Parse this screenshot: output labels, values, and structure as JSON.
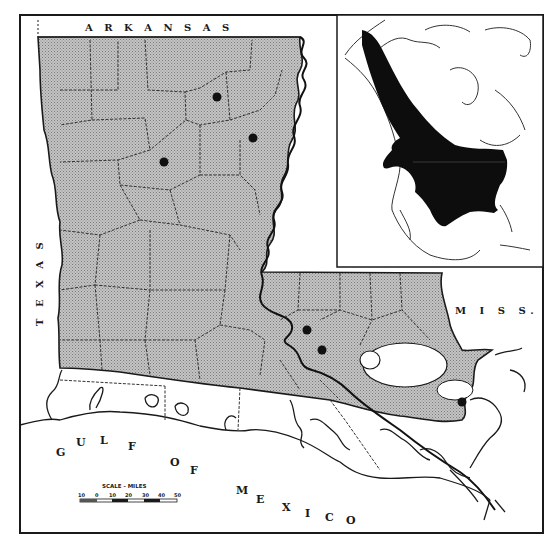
{
  "labels": {
    "north": "A R K A N S A S",
    "west": "T E X A S",
    "east": "M I S S.",
    "gulf_1": [
      "G",
      "U",
      "L",
      "F"
    ],
    "gulf_2": [
      "O",
      "F"
    ],
    "gulf_3": [
      "M",
      "E",
      "X",
      "I",
      "C",
      "O"
    ]
  },
  "scale": {
    "title": "SCALE - MILES",
    "ticks": [
      "10",
      "0",
      "10",
      "20",
      "30",
      "40",
      "50"
    ]
  },
  "colors": {
    "range_fill": "#b8b8b8",
    "inset_range": "#0d0d0d",
    "border": "#1a1a1a",
    "locality_dot": "#111111"
  },
  "locality_dots": [
    {
      "x": 217,
      "y": 97
    },
    {
      "x": 253,
      "y": 138
    },
    {
      "x": 164,
      "y": 162
    },
    {
      "x": 307,
      "y": 330
    },
    {
      "x": 322,
      "y": 350
    },
    {
      "x": 462,
      "y": 402
    }
  ]
}
